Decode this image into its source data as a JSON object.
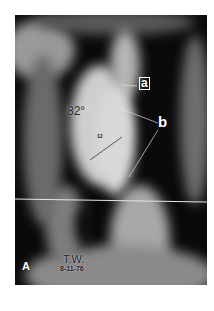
{
  "figure": {
    "panel_letter": "A",
    "patient_initials": "T.W.",
    "date": "8-11-76",
    "angle_label": "82°",
    "vertebra_label": "12",
    "annotation_a": "a",
    "annotation_b": "b"
  },
  "colors": {
    "background": "#ffffff",
    "film_dark": "#0a0a0a",
    "bone_light": "#d8d8d8",
    "reference_line": "#e6e6e6"
  }
}
